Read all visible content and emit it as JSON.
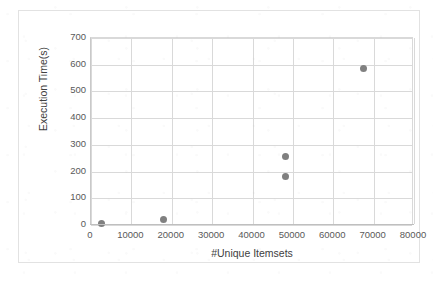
{
  "chart_data": {
    "type": "scatter",
    "title": "",
    "xlabel": "#Unique Itemsets",
    "ylabel": "Execution Time(s)",
    "xlim": [
      0,
      80000
    ],
    "ylim": [
      0,
      700
    ],
    "xticks": [
      0,
      10000,
      20000,
      30000,
      40000,
      50000,
      60000,
      70000,
      80000
    ],
    "xtick_labels": [
      "0",
      "10000",
      "20000",
      "30000",
      "40000",
      "50000",
      "60000",
      "70000",
      "80000"
    ],
    "yticks": [
      0,
      100,
      200,
      300,
      400,
      500,
      600,
      700
    ],
    "ytick_labels": [
      "0",
      "100",
      "200",
      "300",
      "400",
      "500",
      "600",
      "700"
    ],
    "grid": true,
    "grid_axis": "both",
    "legend": false,
    "marker_color": "#808080",
    "marker_shape": "circle",
    "series": [
      {
        "name": "Execution Time",
        "points": [
          {
            "x": 2700,
            "y": 4
          },
          {
            "x": 18000,
            "y": 22
          },
          {
            "x": 48200,
            "y": 258
          },
          {
            "x": 48200,
            "y": 180
          },
          {
            "x": 67400,
            "y": 585
          }
        ]
      }
    ]
  },
  "style": {
    "plot_background": "#ffffff",
    "frame_border_color": "#e2e2e2",
    "grid_color": "#d9d9d9",
    "axis_color": "#bfbfbf",
    "tick_label_color": "#595959",
    "axis_title_color": "#404040"
  }
}
